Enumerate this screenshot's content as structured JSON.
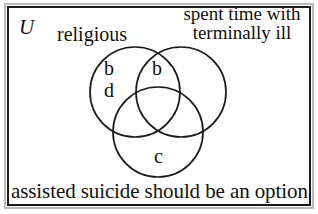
{
  "diagram": {
    "type": "venn-3-set",
    "universe_symbol": "U",
    "border_color": "#1a1a1a",
    "background_color": "#ffffff",
    "text_color": "#111111"
  },
  "labels": {
    "set_left": "religious",
    "set_right_line1": "spent time with",
    "set_right_line2": "terminally ill",
    "set_bottom": "assisted suicide should be an option"
  },
  "regions": [
    {
      "id": "left-only",
      "letter": "b",
      "set": "religious"
    },
    {
      "id": "left-only-2",
      "letter": "d",
      "set": "religious"
    },
    {
      "id": "left-right-top",
      "letter": "b",
      "set": "religious and spent time with terminally ill"
    },
    {
      "id": "bottom-only",
      "letter": "c",
      "set": "assisted suicide should be an option"
    }
  ],
  "circles": [
    {
      "id": "circle-religious",
      "cx": 135,
      "cy": 92,
      "r": 45
    },
    {
      "id": "circle-terminally-ill",
      "cx": 181,
      "cy": 92,
      "r": 45
    },
    {
      "id": "circle-assisted-suicide",
      "cx": 158,
      "cy": 132,
      "r": 45
    }
  ]
}
